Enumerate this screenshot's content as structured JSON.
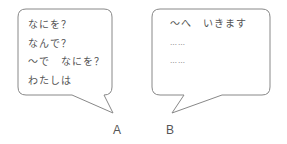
{
  "bubble_a": {
    "lines": [
      "なにを？",
      "なんで？",
      "〜で　なにを？",
      "わたしは"
    ],
    "label": "A"
  },
  "bubble_b": {
    "lines": [
      "〜へ　いきます",
      "……",
      "……"
    ],
    "label": "B"
  },
  "colors": {
    "stroke": "#888888",
    "text": "#555555"
  }
}
